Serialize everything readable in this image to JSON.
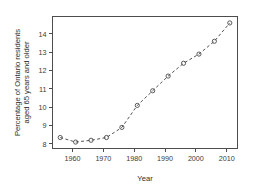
{
  "chart_data": {
    "type": "line",
    "title": "",
    "xlabel": "Year",
    "ylabel": "Percentage of Ontario residents aged 65 years and older",
    "ylabel_line1": "Percentage of Ontario residents",
    "ylabel_line2": "aged  65 years and older",
    "x": [
      1956,
      1961,
      1966,
      1971,
      1976,
      1981,
      1986,
      1991,
      1996,
      2001,
      2006,
      2011
    ],
    "values": [
      8.35,
      8.1,
      8.2,
      8.35,
      8.9,
      10.1,
      10.9,
      11.7,
      12.4,
      12.9,
      13.6,
      14.6
    ],
    "xlim": [
      1953.5,
      2013.5
    ],
    "ylim": [
      7.75,
      14.95
    ],
    "xticks": [
      1960,
      1970,
      1980,
      1990,
      2000,
      2010
    ],
    "xtick_labels": [
      "1960",
      "1970",
      "1980",
      "1990",
      "2000",
      "2010"
    ],
    "yticks": [
      8,
      9,
      10,
      11,
      12,
      13,
      14
    ],
    "ytick_labels": [
      "8",
      "9",
      "10",
      "11",
      "12",
      "13",
      "14"
    ],
    "grid": false,
    "legend": null,
    "marker": "open-circle",
    "linestyle": "dashed",
    "series_color": "#555555"
  }
}
